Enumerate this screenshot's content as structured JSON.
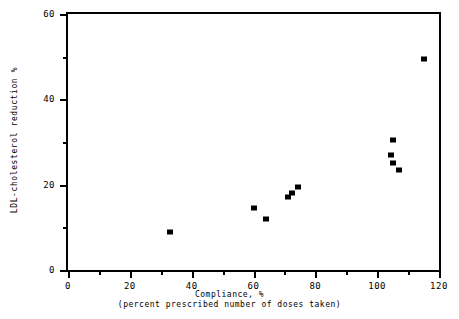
{
  "chart_data": {
    "type": "scatter",
    "title": "",
    "xlabel": "Compliance, %",
    "xlabel_sub": "(percent prescribed number of doses taken)",
    "ylabel": "LDL-cholesterol reduction %",
    "xlim": [
      0,
      120
    ],
    "ylim": [
      0,
      60
    ],
    "x_ticks": [
      0,
      20,
      40,
      60,
      80,
      100,
      120
    ],
    "x_tick_labels": [
      "0",
      "20",
      "40",
      "60",
      "80",
      "100",
      "120"
    ],
    "x_minor_ticks": [
      10,
      30,
      50,
      70,
      90,
      110
    ],
    "y_ticks": [
      0,
      20,
      40,
      60
    ],
    "y_tick_labels": [
      "0",
      "20",
      "40",
      "60"
    ],
    "y_minor_ticks": [
      10,
      30,
      50
    ],
    "grid": false,
    "legend": false,
    "marker": "filled-square",
    "marker_color": "#000000",
    "points": [
      {
        "x": 33,
        "y": 9
      },
      {
        "x": 60,
        "y": 14.5
      },
      {
        "x": 64,
        "y": 12
      },
      {
        "x": 71,
        "y": 17
      },
      {
        "x": 72.5,
        "y": 18
      },
      {
        "x": 74.5,
        "y": 19.5
      },
      {
        "x": 105,
        "y": 30.5
      },
      {
        "x": 104.5,
        "y": 27
      },
      {
        "x": 105,
        "y": 25
      },
      {
        "x": 107,
        "y": 23.5
      },
      {
        "x": 115,
        "y": 49.5
      }
    ]
  },
  "figure": {
    "background_color": "#ffffff",
    "axis_color": "#000000"
  }
}
